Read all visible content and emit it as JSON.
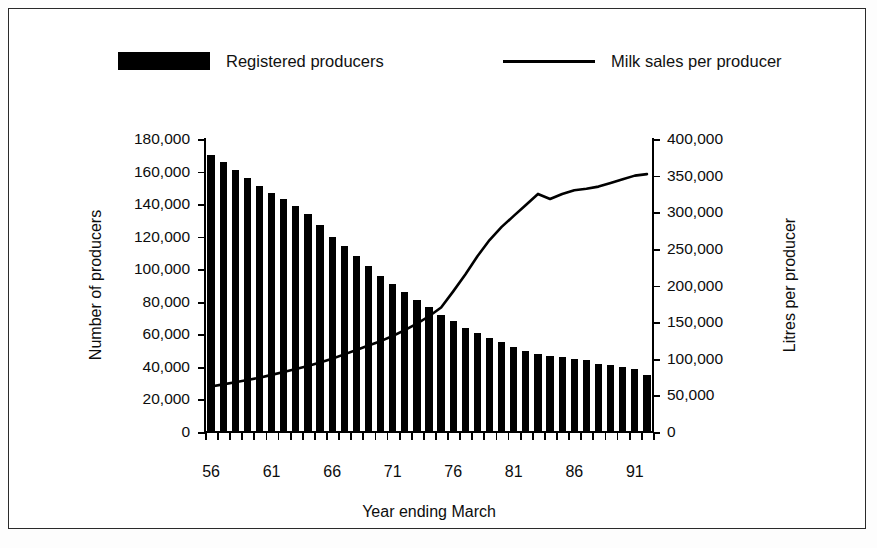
{
  "chart_data": {
    "type": "bar",
    "title": "",
    "xlabel": "Year ending March",
    "ylabel": "Number of producers",
    "ylabel_secondary": "Litres per producer",
    "grid": false,
    "legend_position": "top",
    "ylim": [
      0,
      180000
    ],
    "ylim_secondary": [
      0,
      400000
    ],
    "ytick_labels": [
      "0",
      "20,000",
      "40,000",
      "60,000",
      "80,000",
      "100,000",
      "120,000",
      "140,000",
      "160,000",
      "180,000"
    ],
    "ytick_values": [
      0,
      20000,
      40000,
      60000,
      80000,
      100000,
      120000,
      140000,
      160000,
      180000
    ],
    "ytick_labels_secondary": [
      "0",
      "50,000",
      "100,000",
      "150,000",
      "200,000",
      "250,000",
      "300,000",
      "350,000",
      "400,000"
    ],
    "ytick_values_secondary": [
      0,
      50000,
      100000,
      150000,
      200000,
      250000,
      300000,
      350000,
      400000
    ],
    "categories": [
      "56",
      "57",
      "58",
      "59",
      "60",
      "61",
      "62",
      "63",
      "64",
      "65",
      "66",
      "67",
      "68",
      "69",
      "70",
      "71",
      "72",
      "73",
      "74",
      "75",
      "76",
      "77",
      "78",
      "79",
      "80",
      "81",
      "82",
      "83",
      "84",
      "85",
      "86",
      "87",
      "88",
      "89",
      "90",
      "91",
      "92"
    ],
    "xtick_labels": [
      "56",
      "61",
      "66",
      "71",
      "76",
      "81",
      "86",
      "91"
    ],
    "xtick_label_categories": [
      "56",
      "61",
      "66",
      "71",
      "76",
      "81",
      "86",
      "91"
    ],
    "series": [
      {
        "name": "Registered producers",
        "type": "bar",
        "axis": "left",
        "unit": "producers",
        "color": "#000000",
        "values": [
          170000,
          166000,
          161000,
          156000,
          151000,
          147000,
          143000,
          139000,
          134000,
          127000,
          120000,
          114000,
          108000,
          102000,
          96000,
          91000,
          86000,
          81000,
          77000,
          72000,
          68000,
          64000,
          61000,
          58000,
          55000,
          52000,
          50000,
          48000,
          47000,
          46000,
          45000,
          44000,
          42000,
          41000,
          40000,
          39000,
          35000
        ]
      },
      {
        "name": "Milk sales per producer",
        "type": "line",
        "axis": "right",
        "unit": "litres",
        "color": "#000000",
        "values": [
          62000,
          65000,
          68000,
          71000,
          74000,
          78000,
          82000,
          86000,
          90000,
          95000,
          100000,
          106000,
          112000,
          118000,
          124000,
          131000,
          139000,
          148000,
          158000,
          170000,
          192000,
          215000,
          240000,
          262000,
          280000,
          295000,
          310000,
          325000,
          318000,
          325000,
          330000,
          332000,
          335000,
          340000,
          345000,
          350000,
          352000
        ]
      }
    ]
  },
  "legend": {
    "entries": [
      {
        "label": "Registered producers",
        "marker": "filled-rect"
      },
      {
        "label": "Milk sales per producer",
        "marker": "line"
      }
    ]
  },
  "axes": {
    "left_title": "Number of producers",
    "right_title": "Litres per producer",
    "bottom_title": "Year ending March"
  }
}
